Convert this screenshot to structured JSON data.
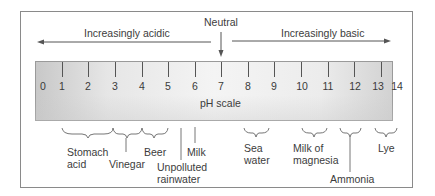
{
  "header": {
    "neutral_label": "Neutral",
    "acidic_label": "Increasingly acidic",
    "basic_label": "Increasingly basic"
  },
  "scale": {
    "label": "pH scale",
    "ticks": [
      "0",
      "1",
      "2",
      "3",
      "4",
      "5",
      "6",
      "7",
      "8",
      "9",
      "10",
      "11",
      "12",
      "13",
      "14"
    ]
  },
  "substances": [
    {
      "name": "stomach-acid",
      "line1": "Stomach",
      "line2": "acid",
      "ph_range": "1-2"
    },
    {
      "name": "vinegar",
      "line1": "Vinegar",
      "line2": "",
      "ph_range": "2-3"
    },
    {
      "name": "beer",
      "line1": "Beer",
      "line2": "",
      "ph_range": "3-4"
    },
    {
      "name": "unpolluted-rainwater",
      "line1": "Unpolluted",
      "line2": "rainwater",
      "ph_range": "5.6"
    },
    {
      "name": "milk",
      "line1": "Milk",
      "line2": "",
      "ph_range": "6.5"
    },
    {
      "name": "sea-water",
      "line1": "Sea",
      "line2": "water",
      "ph_range": "7.5-8.5"
    },
    {
      "name": "milk-of-magnesia",
      "line1": "Milk of",
      "line2": "magnesia",
      "ph_range": "10-11"
    },
    {
      "name": "ammonia",
      "line1": "Ammonia",
      "line2": "",
      "ph_range": "11.5-12.5"
    },
    {
      "name": "lye",
      "line1": "Lye",
      "line2": "",
      "ph_range": "13-14"
    }
  ],
  "colors": {
    "line": "#555555",
    "text": "#3a3a3a",
    "bar_edge": "#c8c8c8",
    "bar_center": "#f4f4f4"
  }
}
